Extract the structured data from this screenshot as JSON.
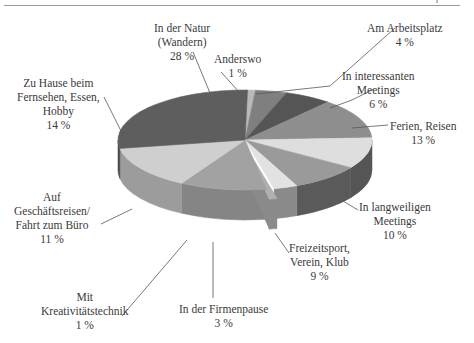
{
  "chart_data": {
    "type": "pie",
    "style": "3d-exploded",
    "title": "",
    "unit": "%",
    "slices": [
      {
        "label": "Anderswo",
        "value": 1,
        "label_lines": [
          "Anderswo",
          "1 %"
        ],
        "color": "#b9b9b9",
        "side": "#8f8f8f"
      },
      {
        "label": "Am Arbeitsplatz",
        "value": 4,
        "label_lines": [
          "Am Arbeitsplatz",
          "4 %"
        ],
        "color": "#7f7f7f",
        "side": "#606060"
      },
      {
        "label": "In interessanten Meetings",
        "value": 6,
        "label_lines": [
          "In interessanten",
          "Meetings",
          "6 %"
        ],
        "color": "#555555",
        "side": "#3f3f3f"
      },
      {
        "label": "Ferien, Reisen",
        "value": 13,
        "label_lines": [
          "Ferien, Reisen",
          "13 %"
        ],
        "color": "#8e8e8e",
        "side": "#6a6a6a"
      },
      {
        "label": "In langweiligen Meetings",
        "value": 10,
        "label_lines": [
          "In langweiligen",
          "Meetings",
          "10 %"
        ],
        "color": "#dedede",
        "side": "#555555"
      },
      {
        "label": "Freizeitsport, Verein, Klub",
        "value": 9,
        "label_lines": [
          "Freizeitsport,",
          "Verein, Klub",
          "9 %"
        ],
        "color": "#9a9a9a",
        "side": "#5a5a5a"
      },
      {
        "label": "In der Firmenpause",
        "value": 3,
        "label_lines": [
          "In der Firmenpause",
          "3 %"
        ],
        "color": "#e2e2e2",
        "side": "#8a8a8a"
      },
      {
        "label": "Mit Kreativitätstechnik",
        "value": 1,
        "label_lines": [
          "Mit",
          "Kreativitätstechnik",
          "1 %"
        ],
        "color": "#b0b0b0",
        "side": "#8a8a8a",
        "exploded": true
      },
      {
        "label": "Auf Geschäftsreisen/ Fahrt zum Büro",
        "value": 11,
        "label_lines": [
          "Auf",
          "Geschäftsreisen/",
          "Fahrt zum Büro",
          "11 %"
        ],
        "color": "#a2a2a2",
        "side": "#858585"
      },
      {
        "label": "Zu Hause beim Fernsehen, Essen, Hobby",
        "value": 14,
        "label_lines": [
          "Zu Hause beim",
          "Fernsehen, Essen,",
          "Hobby",
          "14 %"
        ],
        "color": "#cfcfcf",
        "side": "#9c9c9c"
      },
      {
        "label": "In der Natur (Wandern)",
        "value": 28,
        "label_lines": [
          "In der Natur",
          "(Wandern)",
          "28 %"
        ],
        "color": "#5e5e5e",
        "side": "#474747"
      }
    ],
    "legend": "none",
    "grid": false
  }
}
